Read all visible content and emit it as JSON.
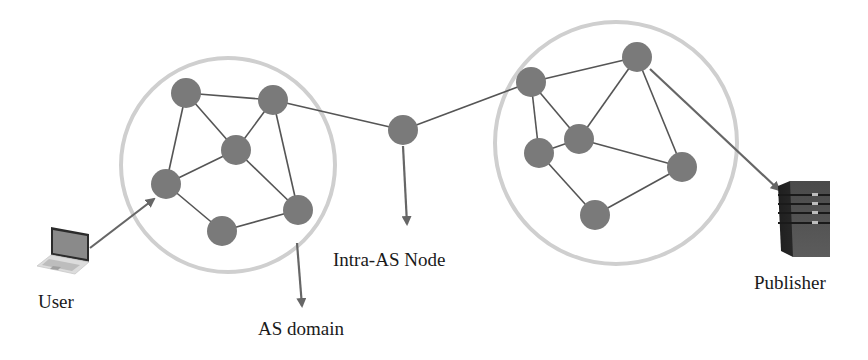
{
  "colors": {
    "background": "#ffffff",
    "node_fill": "#7a7a7a",
    "edge": "#555555",
    "arrow": "#666666",
    "domain_ring": "#cfcfcf",
    "text": "#1a1a1a",
    "server_body": "#3f3f3f",
    "laptop_screen": "#808080"
  },
  "labels": {
    "user": "User",
    "as_domain": "AS domain",
    "intra_as_node": "Intra-AS Node",
    "publisher": "Publisher"
  },
  "domains": [
    {
      "id": "left-as-domain",
      "cx": 228,
      "cy": 165,
      "r": 107
    },
    {
      "id": "right-as-domain",
      "cx": 616,
      "cy": 143,
      "r": 121
    }
  ],
  "nodes": [
    {
      "id": "L1",
      "x": 186,
      "y": 93
    },
    {
      "id": "L2",
      "x": 273,
      "y": 100
    },
    {
      "id": "L3",
      "x": 236,
      "y": 150
    },
    {
      "id": "L4",
      "x": 166,
      "y": 184
    },
    {
      "id": "L5",
      "x": 298,
      "y": 210
    },
    {
      "id": "L6",
      "x": 222,
      "y": 231
    },
    {
      "id": "X",
      "x": 403,
      "y": 130
    },
    {
      "id": "R1",
      "x": 531,
      "y": 82
    },
    {
      "id": "R2",
      "x": 637,
      "y": 57
    },
    {
      "id": "R3",
      "x": 579,
      "y": 139
    },
    {
      "id": "R4",
      "x": 539,
      "y": 153
    },
    {
      "id": "R5",
      "x": 682,
      "y": 167
    },
    {
      "id": "R6",
      "x": 595,
      "y": 215
    }
  ],
  "node_radius": 15,
  "edges": [
    [
      "L1",
      "L2"
    ],
    [
      "L1",
      "L3"
    ],
    [
      "L1",
      "L4"
    ],
    [
      "L2",
      "L3"
    ],
    [
      "L2",
      "L5"
    ],
    [
      "L3",
      "L4"
    ],
    [
      "L3",
      "L5"
    ],
    [
      "L4",
      "L6"
    ],
    [
      "L6",
      "L5"
    ],
    [
      "L2",
      "X"
    ],
    [
      "X",
      "R1"
    ],
    [
      "R1",
      "R2"
    ],
    [
      "R1",
      "R3"
    ],
    [
      "R1",
      "R4"
    ],
    [
      "R2",
      "R3"
    ],
    [
      "R2",
      "R5"
    ],
    [
      "R3",
      "R4"
    ],
    [
      "R3",
      "R5"
    ],
    [
      "R4",
      "R6"
    ],
    [
      "R6",
      "R5"
    ]
  ],
  "arrows": [
    {
      "id": "user-to-domain-arrow",
      "x1": 90,
      "y1": 248,
      "x2": 154,
      "y2": 199
    },
    {
      "id": "intra-node-label-arrow",
      "x1": 403,
      "y1": 146,
      "x2": 407,
      "y2": 224
    },
    {
      "id": "as-domain-label-arrow",
      "x1": 297,
      "y1": 243,
      "x2": 302,
      "y2": 306
    },
    {
      "id": "domain-to-publisher-arrow",
      "x1": 650,
      "y1": 69,
      "x2": 779,
      "y2": 190
    }
  ]
}
